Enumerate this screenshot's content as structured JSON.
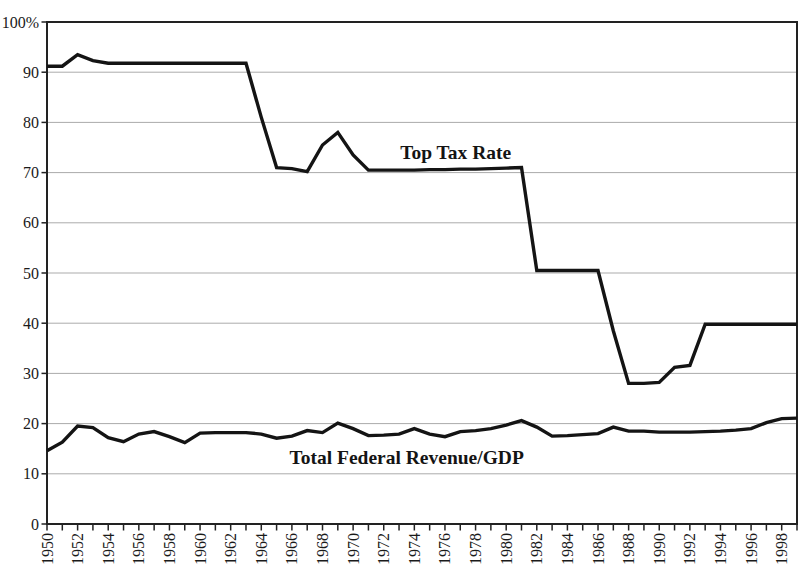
{
  "chart_data": {
    "type": "line",
    "title": "",
    "x_start": 1950,
    "x_end": 1999,
    "x_tick_step": 1,
    "x_label_years": [
      1950,
      1952,
      1954,
      1956,
      1958,
      1960,
      1962,
      1964,
      1966,
      1968,
      1970,
      1972,
      1974,
      1976,
      1978,
      1980,
      1982,
      1984,
      1986,
      1988,
      1990,
      1992,
      1994,
      1996,
      1998
    ],
    "ylim": [
      0,
      100
    ],
    "yticks": [
      {
        "value": 100,
        "label": "100%"
      },
      {
        "value": 90,
        "label": "90"
      },
      {
        "value": 80,
        "label": "80"
      },
      {
        "value": 70,
        "label": "70"
      },
      {
        "value": 60,
        "label": "60"
      },
      {
        "value": 50,
        "label": "50"
      },
      {
        "value": 40,
        "label": "40"
      },
      {
        "value": 30,
        "label": "30"
      },
      {
        "value": 20,
        "label": "20"
      },
      {
        "value": 10,
        "label": "10"
      },
      {
        "value": 0,
        "label": "0"
      }
    ],
    "grid": true,
    "legend_position": "inline-annotations",
    "series": [
      {
        "name": "Top Tax Rate",
        "color": "#141414",
        "values": [
          91.2,
          91.2,
          93.5,
          92.3,
          91.8,
          91.8,
          91.8,
          91.8,
          91.8,
          91.8,
          91.8,
          91.8,
          91.8,
          91.8,
          81,
          71,
          70.8,
          70.2,
          75.5,
          78,
          73.5,
          70.5,
          70.5,
          70.5,
          70.5,
          70.6,
          70.6,
          70.7,
          70.7,
          70.8,
          70.9,
          71,
          50.5,
          50.5,
          50.5,
          50.5,
          50.5,
          38.5,
          28,
          28,
          28.2,
          31.2,
          31.6,
          39.8,
          39.8,
          39.8,
          39.8,
          39.8,
          39.8,
          39.8
        ]
      },
      {
        "name": "Total Federal Revenue/GDP",
        "color": "#141414",
        "values": [
          14.6,
          16.3,
          19.5,
          19.2,
          17.2,
          16.4,
          17.9,
          18.4,
          17.4,
          16.2,
          18.1,
          18.2,
          18.2,
          18.2,
          17.9,
          17.1,
          17.5,
          18.6,
          18.2,
          20.1,
          19.0,
          17.6,
          17.7,
          17.9,
          19.0,
          17.9,
          17.4,
          18.4,
          18.6,
          19.0,
          19.7,
          20.6,
          19.3,
          17.5,
          17.6,
          17.8,
          18.0,
          19.3,
          18.5,
          18.5,
          18.3,
          18.3,
          18.3,
          18.4,
          18.5,
          18.7,
          19.0,
          20.2,
          21.0,
          21.1
        ]
      }
    ],
    "annotations": [
      {
        "text": "Top Tax Rate",
        "year": 1976.7,
        "value": 74.1
      },
      {
        "text": "Total Federal Revenue/GDP",
        "year": 1973.5,
        "value": 13.3
      }
    ],
    "colors": {
      "line": "#141414",
      "grid": "#ababab",
      "axis": "#222222",
      "text": "#1a1a1a"
    }
  }
}
